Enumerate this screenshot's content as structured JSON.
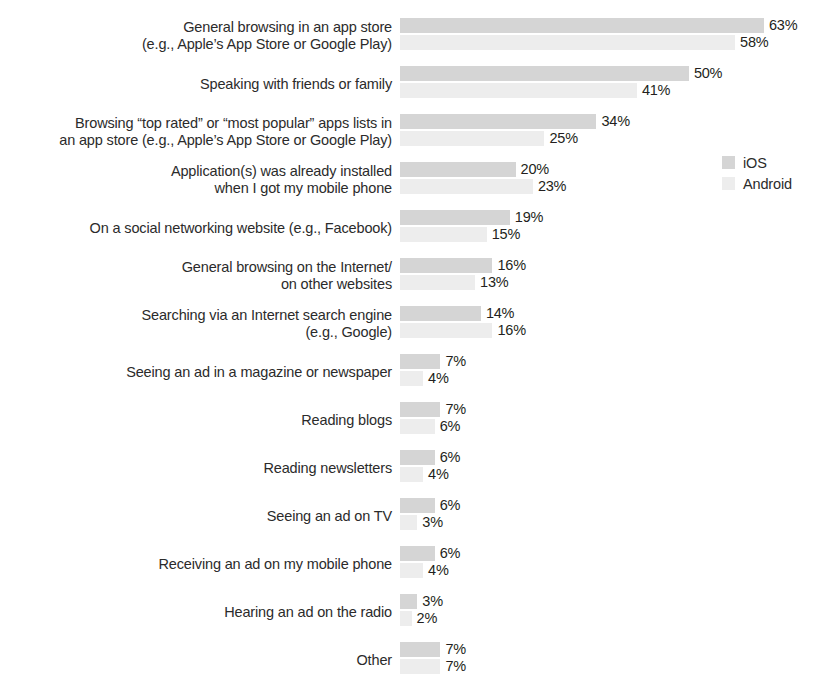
{
  "chart_data": {
    "type": "bar",
    "orientation": "horizontal",
    "title": "",
    "subtitle": "",
    "xlabel": "",
    "ylabel": "",
    "grid": false,
    "axis_visible": false,
    "value_suffix": "%",
    "xlim": [
      0,
      63
    ],
    "legend_position": "right",
    "colors": {
      "ios": "#d5d5d5",
      "android": "#ededed",
      "text": "#231f20"
    },
    "categories": [
      "General browsing in an app store\n(e.g., Apple’s App Store or Google Play)",
      "Speaking with friends or family",
      "Browsing “top rated” or “most popular” apps lists in\nan app store (e.g., Apple’s App Store or Google Play)",
      "Application(s) was already installed\nwhen I got my mobile phone",
      "On a social networking website (e.g., Facebook)",
      "General browsing on the Internet/\non other websites",
      "Searching via an Internet search engine\n(e.g., Google)",
      "Seeing an ad in a magazine or newspaper",
      "Reading blogs",
      "Reading newsletters",
      "Seeing an ad on TV",
      "Receiving an ad on my mobile phone",
      "Hearing an ad on the radio",
      "Other"
    ],
    "series": [
      {
        "name": "iOS",
        "values": [
          63,
          50,
          34,
          20,
          19,
          16,
          14,
          7,
          7,
          6,
          6,
          6,
          3,
          7
        ],
        "labels": [
          "63%",
          "50%",
          "34%",
          "20%",
          "19%",
          "16%",
          "14%",
          "7%",
          "7%",
          "6%",
          "6%",
          "6%",
          "3%",
          "7%"
        ]
      },
      {
        "name": "Android",
        "values": [
          58,
          41,
          25,
          23,
          15,
          13,
          16,
          4,
          6,
          4,
          3,
          4,
          2,
          7
        ],
        "labels": [
          "58%",
          "41%",
          "25%",
          "23%",
          "15%",
          "13%",
          "16%",
          "4%",
          "6%",
          "4%",
          "3%",
          "4%",
          "2%",
          "7%"
        ]
      }
    ]
  },
  "legend": {
    "items": [
      {
        "label": "iOS",
        "swatch": "ios-swatch-icon"
      },
      {
        "label": "Android",
        "swatch": "android-swatch-icon"
      }
    ]
  }
}
